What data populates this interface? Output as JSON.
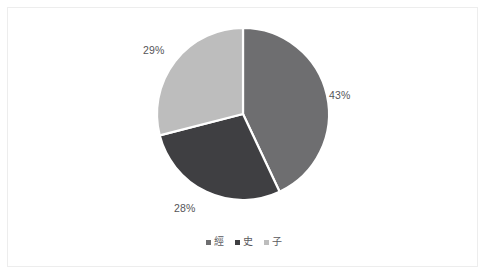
{
  "chart_data": {
    "type": "pie",
    "title": "",
    "subtitle": "",
    "xlabel": "",
    "ylabel": "",
    "grid": false,
    "legend_position": "bottom",
    "start_angle_deg": 0,
    "direction": "clockwise",
    "categories": [
      "經",
      "史",
      "子"
    ],
    "values": [
      43,
      28,
      29
    ],
    "value_unit": "%",
    "data_labels": [
      "43%",
      "28%",
      "29%"
    ],
    "slice_colors": [
      "#6e6e70",
      "#3f3f42",
      "#bdbdbd"
    ],
    "slices": [
      {
        "name": "經",
        "label": "43%",
        "value": 43,
        "color": "#6e6e70"
      },
      {
        "name": "史",
        "label": "28%",
        "value": 28,
        "color": "#3f3f42"
      },
      {
        "name": "子",
        "label": "29%",
        "value": 29,
        "color": "#bdbdbd"
      }
    ]
  },
  "labels": {
    "classics_pct": "43%",
    "history_pct": "28%",
    "masters_pct": "29%"
  },
  "legend": {
    "items": [
      {
        "label": "經",
        "color": "#6e6e70"
      },
      {
        "label": "史",
        "color": "#3f3f42"
      },
      {
        "label": "子",
        "color": "#bdbdbd"
      }
    ]
  },
  "style": {
    "background": "#ffffff",
    "frame_color": "#ededed",
    "slice_separator": "#ffffff",
    "label_color": "#555558"
  }
}
